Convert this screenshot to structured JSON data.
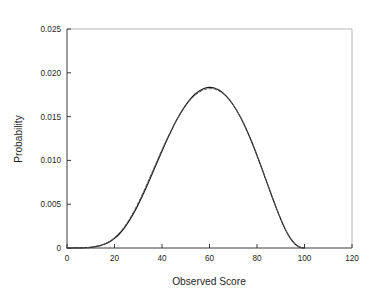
{
  "figure": {
    "background_color": "#ffffff",
    "plot_area": {
      "left_px": 67,
      "right_px": 352,
      "top_px": 29,
      "bottom_px": 248
    },
    "frame": {
      "spine_color": "#3a3a3a",
      "light_spine_color": "#b4b4b4"
    }
  },
  "chart_data": {
    "type": "line",
    "title": "",
    "subtitle": "",
    "xlabel": "Observed Score",
    "ylabel": "Probability",
    "xlim": [
      0,
      120
    ],
    "ylim": [
      0,
      0.025
    ],
    "xticks": [
      0,
      20,
      40,
      60,
      80,
      100,
      120
    ],
    "xtick_labels": [
      "0",
      "20",
      "40",
      "60",
      "80",
      "100",
      "120"
    ],
    "yticks": [
      0,
      0.005,
      0.01,
      0.015,
      0.02,
      0.025
    ],
    "ytick_labels": [
      "0",
      "0.005",
      "0.010",
      "0.015",
      "0.020",
      "0.025"
    ],
    "grid": false,
    "legend": null,
    "legend_position": "none",
    "annotations": [],
    "peak": {
      "x": 53,
      "y": 0.0208
    },
    "support": {
      "min_x": 0,
      "max_x": 100
    },
    "series": [
      {
        "name": "Observed distribution",
        "style": "solid",
        "color": "#141414",
        "width": 1.2,
        "x": [
          0,
          2,
          4,
          6,
          8,
          10,
          12,
          14,
          16,
          18,
          20,
          22,
          24,
          26,
          28,
          30,
          32,
          34,
          36,
          38,
          40,
          42,
          44,
          46,
          48,
          50,
          52,
          54,
          56,
          58,
          60,
          62,
          64,
          66,
          68,
          70,
          72,
          74,
          76,
          78,
          80,
          82,
          84,
          86,
          88,
          90,
          92,
          94,
          96,
          98,
          100
        ],
        "values": [
          0.0,
          0.0,
          1e-05,
          2e-05,
          4e-05,
          8e-05,
          0.00015,
          0.00027,
          0.00045,
          0.00072,
          0.0011,
          0.0016,
          0.00224,
          0.00302,
          0.00393,
          0.00497,
          0.0061,
          0.00731,
          0.00856,
          0.00983,
          0.01108,
          0.0123,
          0.01345,
          0.01452,
          0.01548,
          0.01632,
          0.01702,
          0.01758,
          0.01799,
          0.01824,
          0.01833,
          0.01826,
          0.01802,
          0.01762,
          0.01705,
          0.01632,
          0.01544,
          0.01441,
          0.01324,
          0.01195,
          0.01056,
          0.0091,
          0.0076,
          0.0061,
          0.00464,
          0.00328,
          0.00208,
          0.00112,
          0.00045,
          0.0001,
          0.0
        ]
      },
      {
        "name": "Fitted distribution",
        "style": "dashed",
        "color": "#5a5a5a",
        "width": 1.0,
        "x": [
          0,
          2,
          4,
          6,
          8,
          10,
          12,
          14,
          16,
          18,
          20,
          22,
          24,
          26,
          28,
          30,
          32,
          34,
          36,
          38,
          40,
          42,
          44,
          46,
          48,
          50,
          52,
          54,
          56,
          58,
          60,
          62,
          64,
          66,
          68,
          70,
          72,
          74,
          76,
          78,
          80,
          82,
          84,
          86,
          88,
          90,
          92,
          94,
          96,
          98,
          100
        ],
        "values": [
          0.0,
          0.0,
          1e-05,
          2e-05,
          5e-05,
          9e-05,
          0.00017,
          0.0003,
          0.0005,
          0.00079,
          0.00119,
          0.00172,
          0.00238,
          0.00318,
          0.00411,
          0.00516,
          0.0063,
          0.00751,
          0.00875,
          0.01,
          0.01123,
          0.01241,
          0.01352,
          0.01455,
          0.01546,
          0.01626,
          0.01692,
          0.01745,
          0.01784,
          0.01809,
          0.01819,
          0.01814,
          0.01793,
          0.01756,
          0.01702,
          0.01632,
          0.01546,
          0.01445,
          0.01329,
          0.01201,
          0.01062,
          0.00916,
          0.00766,
          0.00616,
          0.0047,
          0.00333,
          0.00211,
          0.00114,
          0.00046,
          0.0001,
          0.0
        ]
      }
    ]
  }
}
